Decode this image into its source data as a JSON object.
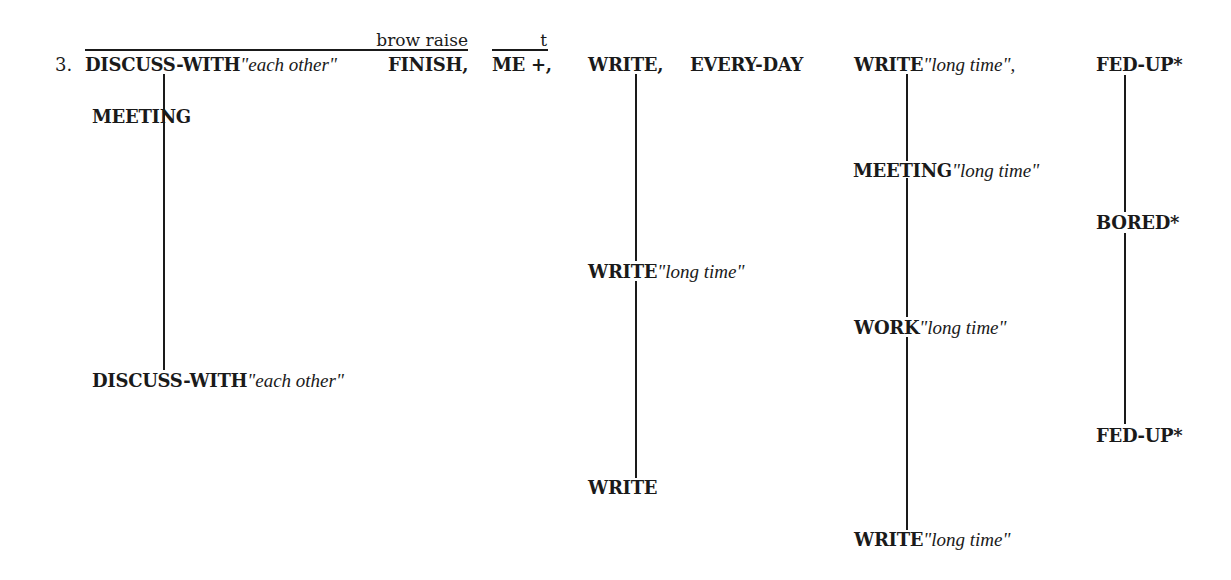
{
  "example": {
    "number": "3.",
    "annotations": [
      {
        "label": "brow raise",
        "spans": "DISCUSS-WITH\"each other\" FINISH,"
      },
      {
        "label": "t",
        "spans": "ME +,"
      }
    ],
    "top_row": [
      {
        "gloss": "DISCUSS-WITH",
        "modifier": "\"each other\""
      },
      {
        "gloss": "FINISH,",
        "modifier": ""
      },
      {
        "gloss": "ME +,",
        "modifier": ""
      },
      {
        "gloss": "WRITE,",
        "modifier": ""
      },
      {
        "gloss": "EVERY-DAY",
        "modifier": ""
      },
      {
        "gloss": "WRITE",
        "modifier": "\"long time\","
      },
      {
        "gloss": "FED-UP*",
        "modifier": ""
      }
    ],
    "columns": [
      {
        "name": "discuss-column",
        "items": [
          {
            "gloss": "MEETING",
            "modifier": ""
          },
          {
            "gloss": "DISCUSS-WITH",
            "modifier": "\"each other\""
          }
        ]
      },
      {
        "name": "write-column",
        "items": [
          {
            "gloss": "WRITE",
            "modifier": "\"long time\""
          },
          {
            "gloss": "WRITE",
            "modifier": ""
          }
        ]
      },
      {
        "name": "write-long-time-column",
        "items": [
          {
            "gloss": "MEETING",
            "modifier": "\"long time\""
          },
          {
            "gloss": "WORK",
            "modifier": "\"long time\""
          },
          {
            "gloss": "WRITE",
            "modifier": "\"long time\""
          }
        ]
      },
      {
        "name": "fed-up-column",
        "items": [
          {
            "gloss": "BORED*",
            "modifier": ""
          },
          {
            "gloss": "FED-UP*",
            "modifier": ""
          }
        ]
      }
    ]
  }
}
